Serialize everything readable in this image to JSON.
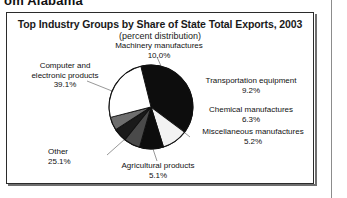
{
  "page": {
    "cut_heading": "om Alabama",
    "right_margin_rule": true
  },
  "figure": {
    "title": "Top Industry Groups by Share of State Total Exports, 2003",
    "subtitle": "(percent distribution)",
    "border_color": "#2b2b2b"
  },
  "chart_data": {
    "type": "pie",
    "title": "Top Industry Groups by Share of State Total Exports, 2003",
    "subtitle": "(percent distribution)",
    "units": "percent",
    "legend": "labels-with-leader-lines",
    "categories": [
      "Computer and electronic products",
      "Machinery manufactures",
      "Transportation equipment",
      "Chemical manufactures",
      "Miscellaneous manufactures",
      "Agricultural products",
      "Other"
    ],
    "values": [
      39.1,
      10.0,
      9.2,
      6.3,
      5.2,
      5.1,
      25.1
    ],
    "value_labels": [
      "39.1%",
      "10.0%",
      "9.2%",
      "6.3%",
      "5.2%",
      "5.1%",
      "25.1%"
    ],
    "slices": [
      {
        "label": "Computer and electronic products",
        "value": 39.1,
        "value_label": "39.1%",
        "color": "#0d0d0d"
      },
      {
        "label": "Machinery manufactures",
        "value": 10.0,
        "value_label": "10.0%",
        "color": "#f2f2f2"
      },
      {
        "label": "Transportation equipment",
        "value": 9.2,
        "value_label": "9.2%",
        "color": "#0d0d0d"
      },
      {
        "label": "Chemical manufactures",
        "value": 6.3,
        "value_label": "6.3%",
        "color": "#4a4a4a"
      },
      {
        "label": "Miscellaneous manufactures",
        "value": 5.2,
        "value_label": "5.2%",
        "color": "#1a1a1a"
      },
      {
        "label": "Agricultural products",
        "value": 5.1,
        "value_label": "5.1%",
        "color": "#6e6e6e"
      },
      {
        "label": "Other",
        "value": 25.1,
        "value_label": "25.1%",
        "color": "#ffffff"
      }
    ]
  },
  "labels": {
    "computer": {
      "line1": "Computer and",
      "line2": "electronic products",
      "pct": "39.1%"
    },
    "machinery": {
      "line1": "Machinery manufactures",
      "pct": "10.0%"
    },
    "transportation": {
      "line1": "Transportation equipment",
      "pct": "9.2%"
    },
    "chemical": {
      "line1": "Chemical manufactures",
      "pct": "6.3%"
    },
    "miscellaneous": {
      "line1": "Miscellaneous manufactures",
      "pct": "5.2%"
    },
    "agricultural": {
      "line1": "Agricultural products",
      "pct": "5.1%"
    },
    "other": {
      "line1": "Other",
      "pct": "25.1%"
    }
  }
}
